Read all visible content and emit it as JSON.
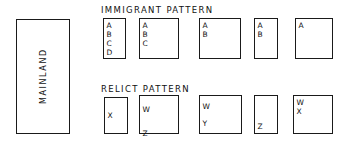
{
  "figure": {
    "mainland": {
      "label": "MAINLAND"
    },
    "immigrant": {
      "header": "IMMIGRANT  PATTERN",
      "boxes": [
        {
          "name": "immigrant-box-1",
          "letters": "A\nB\nC\nD"
        },
        {
          "name": "immigrant-box-2",
          "letters": "A\nB\nC"
        },
        {
          "name": "immigrant-box-3",
          "letters": "A\nB"
        },
        {
          "name": "immigrant-box-4",
          "letters": "A\nB"
        },
        {
          "name": "immigrant-box-5",
          "letters": "A"
        }
      ]
    },
    "relict": {
      "header": "RELICT  PATTERN",
      "boxes": [
        {
          "name": "relict-box-1",
          "letters": "X"
        },
        {
          "name": "relict-box-2",
          "letters": "W\nZ"
        },
        {
          "name": "relict-box-3",
          "letters": "W\nY"
        },
        {
          "name": "relict-box-4",
          "letters": "Z"
        },
        {
          "name": "relict-box-5",
          "letters": "W\nX"
        }
      ]
    }
  },
  "colors": {
    "ink": "#1a1a1a",
    "paper": "#ffffff"
  }
}
